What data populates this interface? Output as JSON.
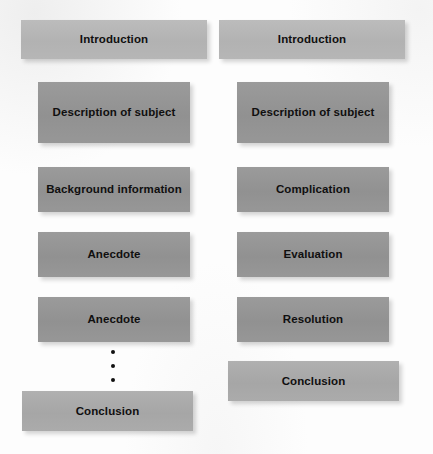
{
  "figure": {
    "kind": "two-column-flow-diagram",
    "background_color": "#fdfdfd",
    "box_light_color": "#b6b6b6",
    "box_dark_color": "#969696",
    "text_color": "#100f0f"
  },
  "columns": [
    {
      "name": "left-column",
      "boxes": [
        {
          "label": "Introduction",
          "shade": "light"
        },
        {
          "label": "Description of subject",
          "shade": "dark"
        },
        {
          "label": "Background information",
          "shade": "dark"
        },
        {
          "label": "Anecdote",
          "shade": "dark"
        },
        {
          "label": "Anecdote",
          "shade": "dark"
        },
        {
          "label": "Conclusion",
          "shade": "midlight"
        }
      ],
      "ellipsis": {
        "dots": 3,
        "orientation": "vertical"
      }
    },
    {
      "name": "right-column",
      "boxes": [
        {
          "label": "Introduction",
          "shade": "light"
        },
        {
          "label": "Description of subject",
          "shade": "dark"
        },
        {
          "label": "Complication",
          "shade": "dark"
        },
        {
          "label": "Evaluation",
          "shade": "dark"
        },
        {
          "label": "Resolution",
          "shade": "dark"
        },
        {
          "label": "Conclusion",
          "shade": "midlight"
        }
      ]
    }
  ]
}
